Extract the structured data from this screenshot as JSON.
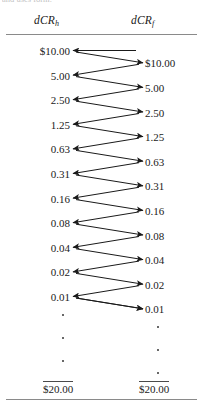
{
  "figure": {
    "top_fragment": "and uses form.",
    "columns": {
      "left": {
        "symbol": "dCR",
        "subscript": "h"
      },
      "right": {
        "symbol": "dCR",
        "subscript": "f"
      }
    },
    "left_values": [
      "$10.00",
      "5.00",
      "2.50",
      "1.25",
      "0.63",
      "0.31",
      "0.16",
      "0.08",
      "0.04",
      "0.02",
      "0.01"
    ],
    "right_values": [
      "$10.00",
      "5.00",
      "2.50",
      "1.25",
      "0.63",
      "0.31",
      "0.16",
      "0.08",
      "0.04",
      "0.02",
      "0.01"
    ],
    "ellipsis": {
      "left_count": 3,
      "right_count": 3
    },
    "totals": {
      "left": "$20.00",
      "right": "$20.00"
    }
  },
  "chart_data": {
    "type": "diagram",
    "title": "",
    "columns": [
      "dCR_h",
      "dCR_f"
    ],
    "series": [
      {
        "name": "dCR_h",
        "values": [
          10.0,
          5.0,
          2.5,
          1.25,
          0.63,
          0.31,
          0.16,
          0.08,
          0.04,
          0.02,
          0.01
        ]
      },
      {
        "name": "dCR_f",
        "values": [
          10.0,
          5.0,
          2.5,
          1.25,
          0.63,
          0.31,
          0.16,
          0.08,
          0.04,
          0.02,
          0.01
        ]
      }
    ],
    "totals": [
      20.0,
      20.0
    ],
    "ratio": 0.5,
    "arrows": "alternating zigzag transfers between the two columns",
    "grid": false,
    "legend": false
  }
}
